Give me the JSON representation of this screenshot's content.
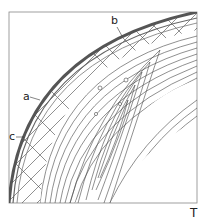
{
  "figure": {
    "labels": {
      "a": "a",
      "b": "b",
      "c": "c",
      "corner": "T"
    },
    "colors": {
      "line": "#333333",
      "outer_band": "#555555",
      "frame": "#777777",
      "background": "#ffffff"
    }
  }
}
